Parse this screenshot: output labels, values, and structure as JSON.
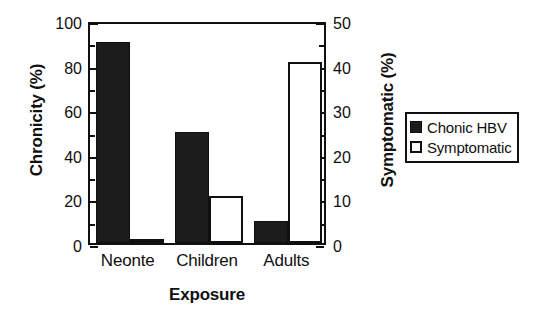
{
  "chart_data": {
    "type": "bar",
    "title": "",
    "xlabel": "Exposure",
    "categories": [
      "Neonte",
      "Children",
      "Adults"
    ],
    "grid": false,
    "legend_position": "right",
    "axes": {
      "left": {
        "label": "Chronicity (%)",
        "lim": [
          0,
          100
        ],
        "ticks": [
          0,
          20,
          40,
          60,
          80,
          100
        ],
        "ticklabels": [
          "0",
          "20",
          "40",
          "60",
          "80",
          "100"
        ],
        "minor_ticks": [
          10,
          30,
          50,
          70,
          90
        ]
      },
      "right": {
        "label": "Symptomatic (%)",
        "lim": [
          0,
          50
        ],
        "ticks": [
          0,
          10,
          20,
          30,
          40,
          50
        ],
        "ticklabels": [
          "0",
          "10",
          "20",
          "30",
          "40",
          "50"
        ],
        "minor_ticks": [
          5,
          15,
          25,
          35,
          45
        ]
      }
    },
    "series": [
      {
        "name": "Chonic HBV",
        "axis": "left",
        "style": "filled",
        "color": "#1c1c1c",
        "values": [
          90,
          50,
          10
        ]
      },
      {
        "name": "Symptomatic",
        "axis": "right",
        "style": "hollow",
        "color": "#ffffff",
        "values": [
          1,
          10.5,
          40.5
        ]
      }
    ]
  },
  "legend": {
    "items": [
      {
        "label": "Chonic HBV",
        "swatch": "filled"
      },
      {
        "label": "Symptomatic",
        "swatch": "hollow"
      }
    ]
  }
}
